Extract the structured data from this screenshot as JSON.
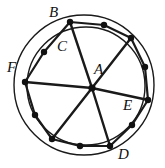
{
  "figure": {
    "type": "geometry-diagram",
    "stroke_color": "#1a1a1a",
    "fill_color": "#ffffff",
    "vertex_dot_color": "#111111",
    "canvas": {
      "width": 165,
      "height": 168
    },
    "outer_circle": {
      "cx": 84,
      "cy": 85,
      "r": 70,
      "stroke_width": 1.4
    },
    "inner_circle": {
      "cx": 86,
      "cy": 86,
      "r": 59,
      "stroke_width": 1.4
    },
    "center_point": {
      "cx": 92,
      "cy": 88
    },
    "polygon_vertices": [
      {
        "id": "v1",
        "x": 70,
        "y": 22
      },
      {
        "id": "v2",
        "x": 104,
        "y": 25
      },
      {
        "id": "v3",
        "x": 131,
        "y": 38
      },
      {
        "id": "v4",
        "x": 145,
        "y": 67
      },
      {
        "id": "v5",
        "x": 148,
        "y": 100
      },
      {
        "id": "v6",
        "x": 132,
        "y": 125
      },
      {
        "id": "v7",
        "x": 110,
        "y": 146
      },
      {
        "id": "v8",
        "x": 80,
        "y": 146
      },
      {
        "id": "v9",
        "x": 52,
        "y": 139
      },
      {
        "id": "v10",
        "x": 35,
        "y": 115
      },
      {
        "id": "v11",
        "x": 25,
        "y": 82
      },
      {
        "id": "v12",
        "x": 44,
        "y": 52
      }
    ],
    "spoke_endpoints": [
      "v1",
      "v3",
      "v5",
      "v7",
      "v9",
      "v11"
    ],
    "labels": [
      {
        "name": "label-B",
        "text": "B",
        "x": 49,
        "y": 5
      },
      {
        "name": "label-C",
        "text": "C",
        "x": 57,
        "y": 39
      },
      {
        "name": "label-F",
        "text": "F",
        "x": 7,
        "y": 60
      },
      {
        "name": "label-A",
        "text": "A",
        "x": 94,
        "y": 62
      },
      {
        "name": "label-E",
        "text": "E",
        "x": 123,
        "y": 98
      },
      {
        "name": "label-D",
        "text": "D",
        "x": 118,
        "y": 147
      }
    ]
  }
}
